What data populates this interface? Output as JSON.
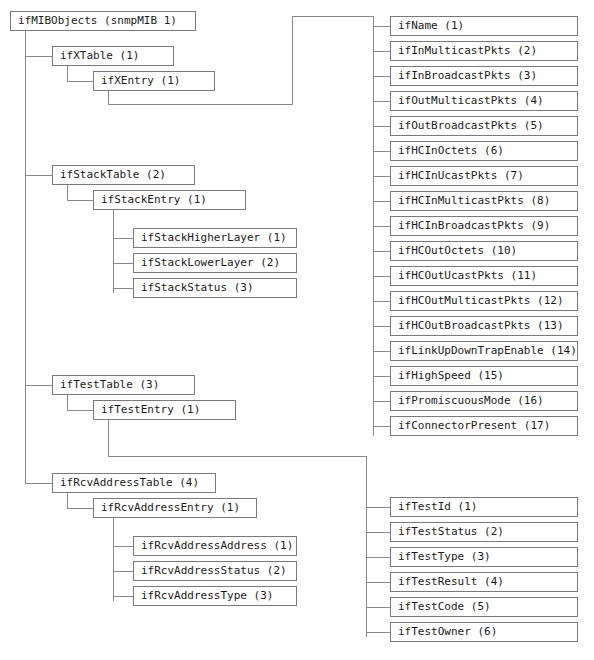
{
  "diagram": {
    "type": "tree",
    "box_border_color": "#7a7a7a",
    "line_color": "#8a8a8a",
    "text_color": "#1a1a1a",
    "background": "#ffffff"
  },
  "nodes": {
    "root": {
      "label": "ifMIBObjects (snmpMIB 1)"
    },
    "ifXTable": {
      "label": "ifXTable (1)"
    },
    "ifXEntry": {
      "label": "ifXEntry (1)"
    },
    "ifStackTable": {
      "label": "ifStackTable (2)"
    },
    "ifStackEntry": {
      "label": "ifStackEntry (1)"
    },
    "ifTestTable": {
      "label": "ifTestTable (3)"
    },
    "ifTestEntry": {
      "label": "ifTestEntry (1)"
    },
    "ifRcvAddressTable": {
      "label": "ifRcvAddressTable (4)"
    },
    "ifRcvAddressEntry": {
      "label": "ifRcvAddressEntry (1)"
    }
  },
  "ifXEntryColumns": [
    {
      "label": "ifName (1)"
    },
    {
      "label": "ifInMulticastPkts (2)"
    },
    {
      "label": "ifInBroadcastPkts (3)"
    },
    {
      "label": "ifOutMulticastPkts (4)"
    },
    {
      "label": "ifOutBroadcastPkts (5)"
    },
    {
      "label": "ifHCInOctets (6)"
    },
    {
      "label": "ifHCInUcastPkts (7)"
    },
    {
      "label": "ifHCInMulticastPkts (8)"
    },
    {
      "label": "ifHCInBroadcastPkts (9)"
    },
    {
      "label": "ifHCOutOctets (10)"
    },
    {
      "label": "ifHCOutUcastPkts (11)"
    },
    {
      "label": "ifHCOutMulticastPkts (12)"
    },
    {
      "label": "ifHCOutBroadcastPkts (13)"
    },
    {
      "label": "ifLinkUpDownTrapEnable (14)"
    },
    {
      "label": "ifHighSpeed (15)"
    },
    {
      "label": "ifPromiscuousMode (16)"
    },
    {
      "label": "ifConnectorPresent (17)"
    }
  ],
  "ifStackEntryColumns": [
    {
      "label": "ifStackHigherLayer (1)"
    },
    {
      "label": "ifStackLowerLayer (2)"
    },
    {
      "label": "ifStackStatus (3)"
    }
  ],
  "ifTestEntryColumns": [
    {
      "label": "ifTestId (1)"
    },
    {
      "label": "ifTestStatus (2)"
    },
    {
      "label": "ifTestType (3)"
    },
    {
      "label": "ifTestResult (4)"
    },
    {
      "label": "ifTestCode (5)"
    },
    {
      "label": "ifTestOwner (6)"
    }
  ],
  "ifRcvAddressEntryColumns": [
    {
      "label": "ifRcvAddressAddress (1)"
    },
    {
      "label": "ifRcvAddressStatus (2)"
    },
    {
      "label": "ifRcvAddressType (3)"
    }
  ]
}
